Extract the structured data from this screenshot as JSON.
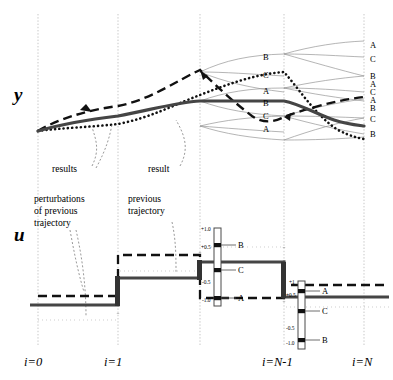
{
  "figure": {
    "type": "diagram",
    "axis_labels": {
      "top": "y",
      "bottom": "u"
    },
    "x_ticks": [
      {
        "label": "i=0",
        "x": 38
      },
      {
        "label": "i=1",
        "x": 118
      },
      {
        "label": "i=N-1",
        "x": 284
      },
      {
        "label": "i=N",
        "x": 364
      }
    ],
    "gridline_x": [
      38,
      118,
      200,
      284,
      364
    ],
    "annotations": [
      {
        "text": "results",
        "x": 62,
        "y": 170
      },
      {
        "text": "result",
        "x": 155,
        "y": 170
      },
      {
        "text": "perturbations",
        "x": 42,
        "y": 200
      },
      {
        "text": "of previous",
        "x": 42,
        "y": 212
      },
      {
        "text": "trajectory",
        "x": 42,
        "y": 224
      },
      {
        "text": "previous",
        "x": 138,
        "y": 200
      },
      {
        "text": "trajectory",
        "x": 138,
        "y": 212
      }
    ]
  },
  "upper_plot": {
    "name": "output-trajectory-plot",
    "mid_labels": [
      {
        "text": "B",
        "x": 266,
        "y": 58
      },
      {
        "text": "C",
        "x": 266,
        "y": 76
      },
      {
        "text": "A",
        "x": 266,
        "y": 92
      },
      {
        "text": "B",
        "x": 266,
        "y": 104
      },
      {
        "text": "C",
        "x": 266,
        "y": 117
      },
      {
        "text": "A",
        "x": 266,
        "y": 130
      }
    ],
    "right_labels": [
      {
        "text": "A",
        "x": 372,
        "y": 46
      },
      {
        "text": "C",
        "x": 372,
        "y": 60
      },
      {
        "text": "B",
        "x": 372,
        "y": 77
      },
      {
        "text": "A",
        "x": 372,
        "y": 85
      },
      {
        "text": "C",
        "x": 372,
        "y": 93
      },
      {
        "text": "A",
        "x": 372,
        "y": 101
      },
      {
        "text": "B",
        "x": 372,
        "y": 109
      },
      {
        "text": "C",
        "x": 372,
        "y": 120
      },
      {
        "text": "B",
        "x": 372,
        "y": 135
      }
    ]
  },
  "lower_plot": {
    "name": "control-input-plot",
    "ruler_left": {
      "x": 218,
      "ticks": [
        {
          "label": "+1.0",
          "y": 231
        },
        {
          "label": "+0.5",
          "y": 249
        },
        {
          "label": "-0.5",
          "y": 284
        },
        {
          "label": "-1.0",
          "y": 302
        }
      ],
      "markers": [
        {
          "label": "B",
          "y": 245
        },
        {
          "label": "C",
          "y": 270
        },
        {
          "label": "A",
          "y": 298
        }
      ]
    },
    "ruler_right": {
      "x": 302,
      "ticks": [
        {
          "label": "+1",
          "y": 284
        },
        {
          "label": "+0.5",
          "y": 297
        },
        {
          "label": "-0.5",
          "y": 330
        },
        {
          "label": "-1.0",
          "y": 345
        }
      ],
      "markers": [
        {
          "label": "A",
          "y": 291
        },
        {
          "label": "C",
          "y": 311
        },
        {
          "label": "B",
          "y": 340
        }
      ]
    }
  },
  "styles": {
    "solid_color": "#454545",
    "dashed_color": "#111111",
    "dotted_color": "#111111",
    "fan_color": "#8d8d8d",
    "grid_color": "#b9b9b9"
  }
}
